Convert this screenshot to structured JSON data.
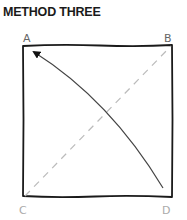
{
  "title": "METHOD THREE",
  "diagram": {
    "corners": [
      {
        "id": "A",
        "label": "A",
        "x": 28,
        "y": 41
      },
      {
        "id": "B",
        "label": "B",
        "x": 168,
        "y": 41
      },
      {
        "id": "C",
        "label": "C",
        "x": 23,
        "y": 214
      },
      {
        "id": "D",
        "label": "D",
        "x": 166,
        "y": 214
      }
    ],
    "square": {
      "x1": 23,
      "y1": 45,
      "x2": 172,
      "y2": 197,
      "stroke": "#1a1a1a"
    },
    "dashed_diagonal": {
      "from": "C",
      "to": "B",
      "stroke": "#bbbbbb"
    },
    "arrow": {
      "from": "D",
      "to": "A",
      "stroke": "#444444"
    }
  }
}
